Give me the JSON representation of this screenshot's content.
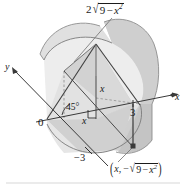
{
  "figure": {
    "type": "math-solid-diagram",
    "background_color": "#ffffff",
    "ink_color": "#1b1b1b"
  },
  "axes": {
    "x_label": "x",
    "y_label": "y",
    "origin_label": "0",
    "x_tick_label": "3",
    "y_tick_label": "−3"
  },
  "labels": {
    "top_coefficient": "2",
    "top_radicand_lead": "9",
    "top_radicand_minus": "−",
    "top_radicand_var": "x",
    "top_radicand_exp": "2",
    "angle": "45°",
    "height_x": "x",
    "base_x": "x",
    "point_open_paren": "(",
    "point_first": "x",
    "point_comma": ",",
    "point_minus": "−",
    "point_radicand_lead": "9",
    "point_radicand_minus": "−",
    "point_radicand_var": "x",
    "point_radicand_exp": "2",
    "point_close_paren": ")",
    "radical_sign": "√"
  },
  "colors": {
    "fill_light": "#ebebeb",
    "fill_mid": "#dcdcdc",
    "fill_dark": "#c9c9c9",
    "fill_darker": "#bdbdbd",
    "line": "#4a4a4a",
    "line_strong": "#2e2e2e",
    "dashed": "#8a8a8a",
    "point_marker": "#3a3a3a",
    "rule": "#cdcdcd"
  },
  "geometry": {
    "circle_radius_value": 3,
    "cross_section_shape": "isosceles right triangle",
    "cross_section_base": "2√(9 − x²)",
    "base_angle_degrees": 45
  }
}
